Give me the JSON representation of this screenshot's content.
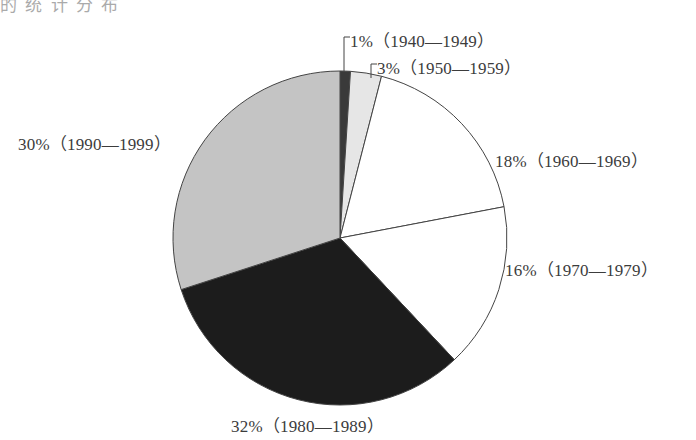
{
  "header_fragment": "的 统 计 分 布",
  "chart_data": {
    "type": "pie",
    "title": "",
    "categories": [
      "1940—1949",
      "1950—1959",
      "1960—1969",
      "1970—1979",
      "1980—1989",
      "1990—1999"
    ],
    "values": [
      1,
      3,
      18,
      16,
      32,
      30
    ],
    "units": "%",
    "labels": [
      "1%（1940—1949）",
      "3%（1950—1959）",
      "18%（1960—1969）",
      "16%（1970—1979）",
      "32%（1980—1989）",
      "30%（1990—1999）"
    ],
    "colors": [
      "#3a3a3a",
      "#e6e6e6",
      "#ffffff",
      "#ffffff",
      "#1c1c1c",
      "#c4c4c4"
    ],
    "start_angle": "12 o'clock",
    "direction": "clockwise",
    "legend": "none (labels placed beside slices)"
  }
}
